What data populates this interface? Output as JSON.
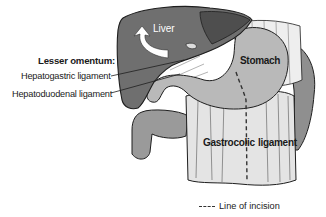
{
  "figure": {
    "labels": {
      "lesser_omentum": "Lesser omentum:",
      "hepatogastric": "Hepatogastric ligament",
      "hepatoduodenal": "Hepatoduodenal ligament",
      "liver": "Liver",
      "stomach": "Stomach",
      "gastrocolic_left": "Gastrocolic",
      "gastrocolic_right": "ligament"
    },
    "legend": {
      "line_style": "dashed",
      "label": "Line of incision"
    },
    "colors": {
      "liver": "#6f6f6f",
      "liver_dark": "#4a4a4a",
      "stomach": "#b8b8b8",
      "omentum": "#e2e2e2",
      "colon": "#9a9a9a",
      "outline": "#1e1e1e"
    }
  }
}
